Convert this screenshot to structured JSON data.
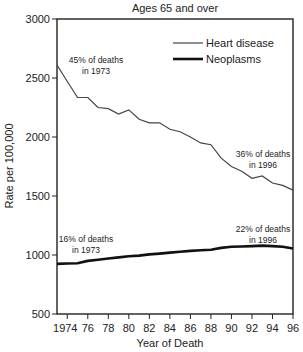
{
  "chart_data": {
    "type": "line",
    "title": "Ages 65 and over",
    "xlabel": "Year of Death",
    "ylabel": "Rate per 100,000",
    "ylim": [
      500,
      3000
    ],
    "xlim": [
      1973,
      1996
    ],
    "yticks": [
      500,
      1000,
      1500,
      2000,
      2500,
      3000
    ],
    "xticks": [
      1974,
      1976,
      1978,
      1980,
      1982,
      1984,
      1986,
      1988,
      1990,
      1992,
      1994,
      1996
    ],
    "xtick_labels": [
      "1974",
      "76",
      "78",
      "80",
      "82",
      "84",
      "86",
      "88",
      "90",
      "92",
      "94",
      "96"
    ],
    "grid": false,
    "legend_position": "upper right",
    "x": [
      1973,
      1974,
      1975,
      1976,
      1977,
      1978,
      1979,
      1980,
      1981,
      1982,
      1983,
      1984,
      1985,
      1986,
      1987,
      1988,
      1989,
      1990,
      1991,
      1992,
      1993,
      1994,
      1995,
      1996
    ],
    "series": [
      {
        "name": "Heart disease",
        "style": "thin",
        "values": [
          2610,
          2470,
          2335,
          2335,
          2250,
          2240,
          2195,
          2230,
          2150,
          2120,
          2120,
          2065,
          2045,
          2000,
          1950,
          1935,
          1820,
          1750,
          1710,
          1650,
          1670,
          1610,
          1590,
          1550
        ]
      },
      {
        "name": "Neoplasms",
        "style": "thick",
        "values": [
          925,
          928,
          930,
          950,
          960,
          970,
          980,
          990,
          995,
          1005,
          1012,
          1020,
          1028,
          1035,
          1040,
          1045,
          1060,
          1070,
          1072,
          1075,
          1080,
          1075,
          1070,
          1055
        ]
      }
    ],
    "annotations": [
      {
        "line1": "45% of deaths",
        "line2": "in 1973",
        "series": "Heart disease"
      },
      {
        "line1": "36% of deaths",
        "line2": "in 1996",
        "series": "Heart disease"
      },
      {
        "line1": "16% of deaths",
        "line2": "in 1973",
        "series": "Neoplasms"
      },
      {
        "line1": "22% of deaths",
        "line2": "in 1996",
        "series": "Neoplasms"
      }
    ]
  }
}
